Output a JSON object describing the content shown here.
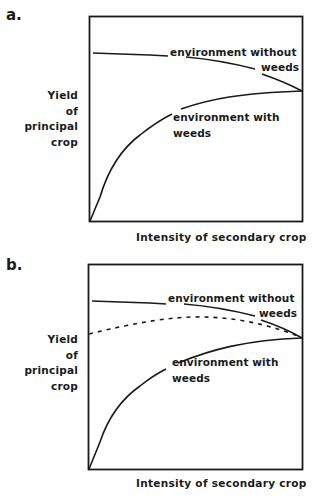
{
  "panels": [
    {
      "label": "a.",
      "y_axis_label": [
        "Yield",
        "of",
        "principal",
        "crop"
      ],
      "x_axis_label": "Intensity of secondary crop",
      "curves": [
        {
          "name": "environment without weeds",
          "label_line1": "environment without",
          "label_line2": "weeds",
          "style": "solid"
        },
        {
          "name": "environment with weeds",
          "label_line1": "environment with",
          "label_line2": "weeds",
          "style": "solid"
        }
      ]
    },
    {
      "label": "b.",
      "y_axis_label": [
        "Yield",
        "of",
        "principal",
        "crop"
      ],
      "x_axis_label": "Intensity of secondary crop",
      "curves": [
        {
          "name": "environment without weeds",
          "label_line1": "environment without",
          "label_line2": "weeds",
          "style": "solid"
        },
        {
          "name": "intermediate (dashed)",
          "style": "dashed"
        },
        {
          "name": "environment with weeds",
          "label_line1": "environment with",
          "label_line2": "weeds",
          "style": "solid"
        }
      ]
    }
  ],
  "colors": {
    "line": "#1a1a1a",
    "background": "#ffffff"
  }
}
